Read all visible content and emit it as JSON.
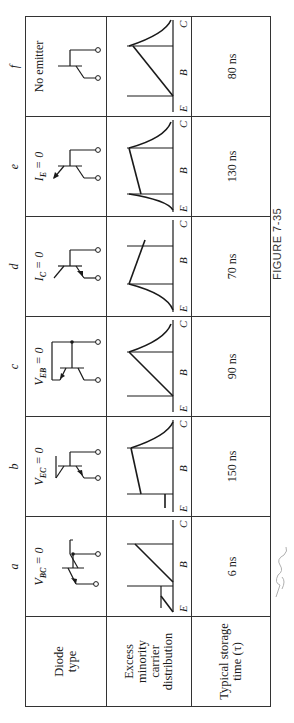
{
  "figure": {
    "caption": "FIGURE 7-35",
    "signature_note": "handwritten annotation (signature) in margin"
  },
  "table": {
    "row_headers": {
      "diode_type": "Diode type",
      "distribution": "Excess minority carrier distribution",
      "storage_time": "Typical storage time (τ)"
    },
    "columns": [
      {
        "letter": "a",
        "condition_main": "V",
        "condition_sub": "BC",
        "condition_rest": " = 0",
        "storage_time": "6 ns",
        "circuit": "emitter-base diode, collector shorted to base",
        "axis": [
          "E",
          "B",
          "C"
        ]
      },
      {
        "letter": "b",
        "condition_main": "V",
        "condition_sub": "EC",
        "condition_rest": " = 0",
        "storage_time": "150 ns",
        "circuit": "collector-base diode, emitter shorted to collector",
        "axis": [
          "E",
          "B",
          "C"
        ]
      },
      {
        "letter": "c",
        "condition_main": "V",
        "condition_sub": "EB",
        "condition_rest": " = 0",
        "storage_time": "90 ns",
        "circuit": "collector-base diode, emitter shorted to base",
        "axis": [
          "E",
          "B",
          "C"
        ]
      },
      {
        "letter": "d",
        "condition_main": "I",
        "condition_sub": "C",
        "condition_rest": " = 0",
        "storage_time": "70 ns",
        "circuit": "emitter-base diode, collector open",
        "axis": [
          "E",
          "B",
          "C"
        ]
      },
      {
        "letter": "e",
        "condition_main": "I",
        "condition_sub": "E",
        "condition_rest": " = 0",
        "storage_time": "130 ns",
        "circuit": "collector-base diode, emitter open",
        "axis": [
          "E",
          "B",
          "C"
        ]
      },
      {
        "letter": "f",
        "condition_main": "No emitter",
        "condition_sub": "",
        "condition_rest": "",
        "storage_time": "80 ns",
        "circuit": "collector-base diode, no emitter",
        "axis": [
          "E",
          "B",
          "C"
        ]
      }
    ]
  },
  "colors": {
    "ink": "#1a1a1a",
    "border": "#333333",
    "pencil": "#b0b0b0",
    "background": "#ffffff"
  }
}
